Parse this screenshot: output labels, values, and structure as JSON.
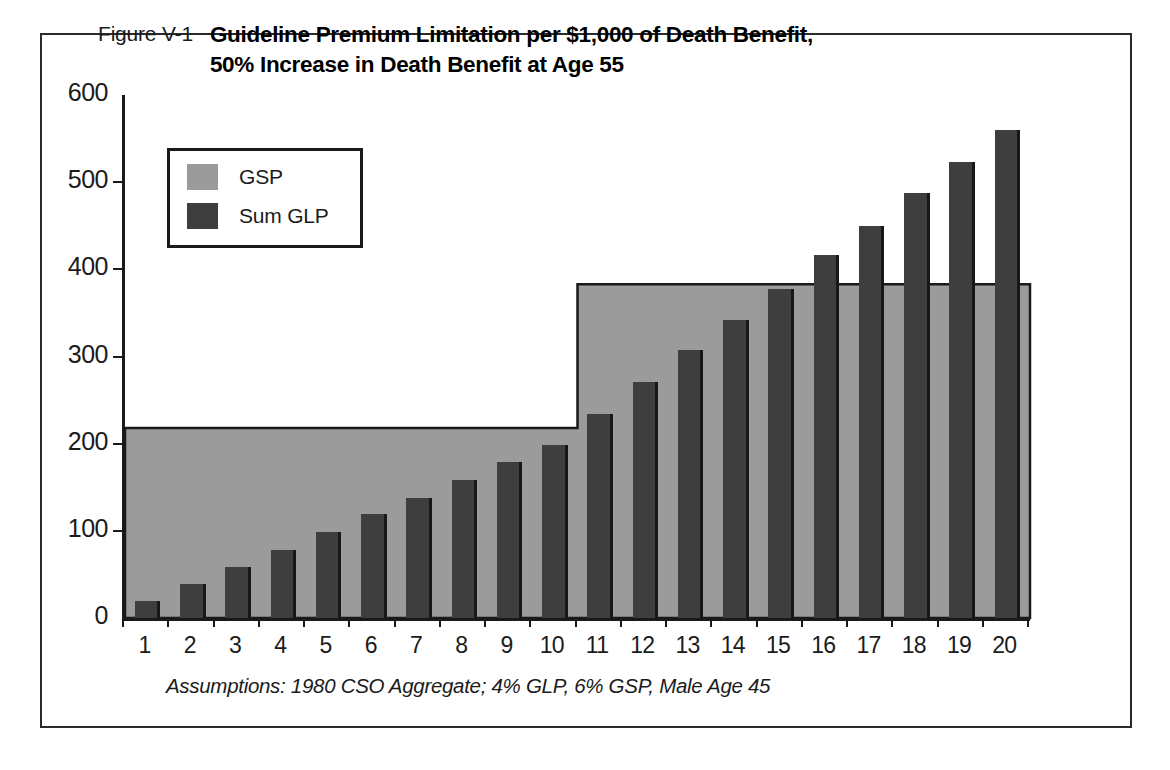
{
  "figure": {
    "number_label": "Figure V-1",
    "title_line1": "Guideline Premium Limitation per $1,000 of Death Benefit,",
    "title_line2": "50% Increase in Death Benefit at Age 55",
    "footnote": "Assumptions: 1980 CSO Aggregate; 4% GLP, 6% GSP, Male Age 45"
  },
  "legend": {
    "items": [
      {
        "label": "GSP",
        "color": "#9b9b9b"
      },
      {
        "label": "Sum GLP",
        "color": "#3e3e3e"
      }
    ]
  },
  "colors": {
    "gsp_fill": "#9b9b9b",
    "glp_fill": "#3e3e3e",
    "axis": "#1a1a1a",
    "frame": "#2b2b2b",
    "background": "#ffffff"
  },
  "axes": {
    "y_ticks": [
      "0",
      "100",
      "200",
      "300",
      "400",
      "500",
      "600"
    ],
    "y_min": 0,
    "y_max": 600,
    "x_ticks": [
      "1",
      "2",
      "3",
      "4",
      "5",
      "6",
      "7",
      "8",
      "9",
      "10",
      "11",
      "12",
      "13",
      "14",
      "15",
      "16",
      "17",
      "18",
      "19",
      "20"
    ]
  },
  "chart_data": {
    "type": "bar",
    "title": "Guideline Premium Limitation per $1,000 of Death Benefit, 50% Increase in Death Benefit at Age 55",
    "subtitle": "Figure V-1",
    "annotations": [
      "Assumptions: 1980 CSO Aggregate; 4% GLP, 6% GSP, Male Age 45"
    ],
    "xlabel": "",
    "ylabel": "",
    "ylim": [
      0,
      600
    ],
    "grid": false,
    "legend_position": "top-left",
    "categories": [
      "1",
      "2",
      "3",
      "4",
      "5",
      "6",
      "7",
      "8",
      "9",
      "10",
      "11",
      "12",
      "13",
      "14",
      "15",
      "16",
      "17",
      "18",
      "19",
      "20"
    ],
    "series": [
      {
        "name": "GSP",
        "type": "step-area",
        "values": [
          218,
          218,
          218,
          218,
          218,
          218,
          218,
          218,
          218,
          218,
          383,
          383,
          383,
          383,
          383,
          383,
          383,
          383,
          383,
          383
        ]
      },
      {
        "name": "Sum GLP",
        "type": "bar",
        "values": [
          19,
          39,
          58,
          78,
          99,
          119,
          138,
          158,
          179,
          198,
          234,
          271,
          307,
          342,
          378,
          416,
          450,
          487,
          523,
          560
        ]
      }
    ]
  }
}
